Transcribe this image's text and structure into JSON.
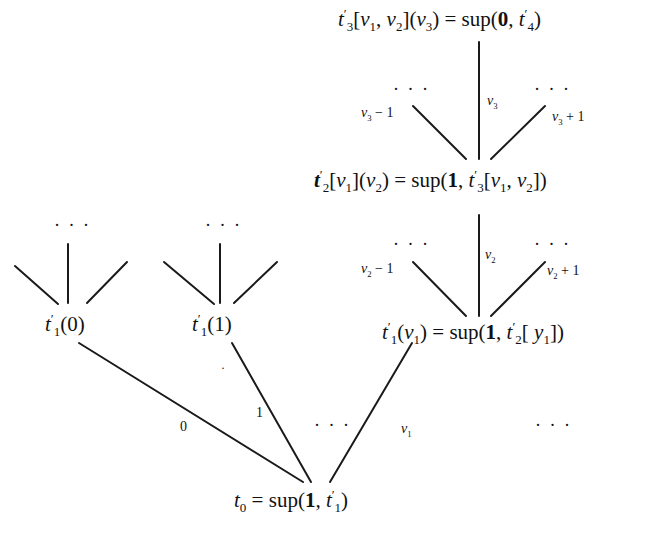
{
  "diagram": {
    "type": "tree",
    "nodes": {
      "root": "t0 = sup(1, t1')",
      "t1_0": "t1'(0)",
      "t1_1": "t1'(1)",
      "t1_v1": "t1'(v1) = sup(1, t2'[y1])",
      "t2": "t2'[v1](v2) = sup(1, t3'[v1, v2])",
      "t3": "t3'[v1, v2](v3) = sup(0, t4')"
    },
    "node_parts": {
      "root": {
        "lhs": "t",
        "lhs_sub": "0",
        "eq": " = sup(",
        "bold": "1",
        "rest": ", t",
        "rest_sup": "′",
        "rest_sub": "1",
        "close": ")"
      },
      "t1_0": {
        "t": "t",
        "sup": "′",
        "sub": "1",
        "arg": "(0)"
      },
      "t1_1": {
        "t": "t",
        "sup": "′",
        "sub": "1",
        "arg": "(1)"
      },
      "t1_v1": {
        "t": "t",
        "sup": "′",
        "sub": "1",
        "arg_open": "(",
        "v": "v",
        "v_sub": "1",
        "arg_close": ")",
        "eq": " = sup(",
        "bold": "1",
        "comma": ", ",
        "t2": "t",
        "t2_sup": "′",
        "t2_sub": "2",
        "idx_open": "[ ",
        "y": "y",
        "y_sub": "1",
        "idx_close": "])"
      },
      "t2": {
        "t": "t",
        "sup": "′",
        "sub": "2",
        "b1": "[",
        "v1": "v",
        "v1_sub": "1",
        "b2": "](",
        "v2": "v",
        "v2_sub": "2",
        "b3": ")",
        "eq": " = sup(",
        "bold": "1",
        "comma": ", ",
        "t3": "t",
        "t3_sup": "′",
        "t3_sub": "3",
        "c1": "[",
        "w1": "v",
        "w1_sub": "1",
        "c2": ", ",
        "w2": "v",
        "w2_sub": "2",
        "c3": "])"
      },
      "t3": {
        "t": "t",
        "sup": "′",
        "sub": "3",
        "b1": "[",
        "v1": "v",
        "v1_sub": "1",
        "c": ", ",
        "v2": "v",
        "v2_sub": "2",
        "b2": "](",
        "v3": "v",
        "v3_sub": "3",
        "b3": ")",
        "eq": " = sup(",
        "bold": "0",
        "comma": ", ",
        "t4": "t",
        "t4_sup": "′",
        "t4_sub": "4",
        "close": ")"
      }
    },
    "edge_labels": {
      "e0": "0",
      "e1": "1",
      "ev1": "v",
      "ev1_sub": "1",
      "v2_minus": {
        "v": "v",
        "sub": "2",
        "op": " − 1"
      },
      "v2": {
        "v": "v",
        "sub": "2"
      },
      "v2_plus": {
        "v": "v",
        "sub": "2",
        "op": " + 1"
      },
      "v3_minus": {
        "v": "v",
        "sub": "3",
        "op": " − 1"
      },
      "v3": {
        "v": "v",
        "sub": "3"
      },
      "v3_plus": {
        "v": "v",
        "sub": "3",
        "op": " + 1"
      }
    },
    "ellipsis": "· · ·"
  }
}
